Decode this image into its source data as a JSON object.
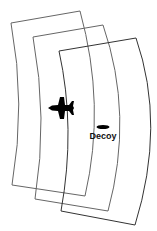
{
  "diagram": {
    "labels": {
      "decoy": "Decoy"
    },
    "icons": {
      "aircraft": "fighter-jet-icon",
      "decoy": "decoy-ellipse-icon"
    },
    "colors": {
      "background": "#ffffff",
      "panel_stroke": "#555555",
      "front_panel_stroke": "#333333",
      "aircraft": "#000000",
      "decoy": "#000000",
      "text": "#111111"
    },
    "wavefronts": [
      {
        "name": "wavefront-1"
      },
      {
        "name": "wavefront-2"
      },
      {
        "name": "wavefront-3"
      }
    ]
  }
}
